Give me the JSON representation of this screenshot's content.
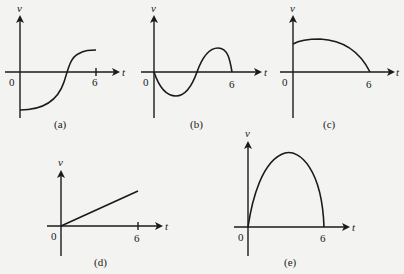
{
  "graphs": [
    {
      "id": "a",
      "caption": "(a)",
      "y_label": "v",
      "x_label": "t",
      "origin_label": "0",
      "tick_label": "6",
      "shape": "S-curve from negative to positive, crossing zero mid-interval"
    },
    {
      "id": "b",
      "caption": "(b)",
      "y_label": "v",
      "x_label": "t",
      "origin_label": "0",
      "tick_label": "6",
      "shape": "one full sine period starting downward, zero at 0, 3, 6"
    },
    {
      "id": "c",
      "caption": "(c)",
      "y_label": "v",
      "x_label": "t",
      "origin_label": "0",
      "tick_label": "6",
      "shape": "starts positive, rises slightly then falls to zero at 6"
    },
    {
      "id": "d",
      "caption": "(d)",
      "y_label": "v",
      "x_label": "t",
      "origin_label": "0",
      "tick_label": "6",
      "shape": "straight line from origin increasing"
    },
    {
      "id": "e",
      "caption": "(e)",
      "y_label": "v",
      "x_label": "t",
      "origin_label": "0",
      "tick_label": "6",
      "shape": "arch from 0 to 6, peak near t=2.5"
    }
  ],
  "colors": {
    "ink": "#1a1a1a",
    "paper": "#f3f3f1"
  }
}
